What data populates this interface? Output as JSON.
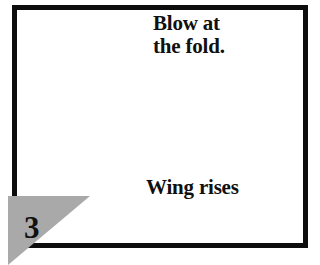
{
  "figure": {
    "type": "instructional-diagram",
    "step_number": "3",
    "frame_color": "#0d0d0d",
    "background_color": "#ffffff"
  },
  "captions": {
    "blow_instruction": "Blow at\nthe fold.",
    "wing_label": "Wing rises"
  },
  "badge": {
    "number": "3",
    "shape": "triangle",
    "fill_color": "#a9a9a9"
  },
  "annotations": {
    "blow_arrow": {
      "name": "air-flow-arrow",
      "direction": "left",
      "fill_color": "#9e9e9e",
      "stroke_color": "#6b6b6b"
    },
    "pointer_arrow": {
      "name": "wing-rises-pointer-arrow",
      "direction": "up-left",
      "color": "#0d0d0d"
    }
  },
  "objects": {
    "ruler": {
      "name": "ruler-straightedge",
      "tick_count": 9,
      "body_color": "#d5d5d5",
      "edge_color": "#6e6e6e"
    },
    "paper_sheet": {
      "name": "paper-sheet",
      "fill_color": "#e9e9e9",
      "texture": "fine-vertical-hatch"
    },
    "paper_fold": {
      "name": "folded-paper-wing",
      "fill_color": "#ffffff",
      "edge_color": "#8a8a8a"
    }
  }
}
